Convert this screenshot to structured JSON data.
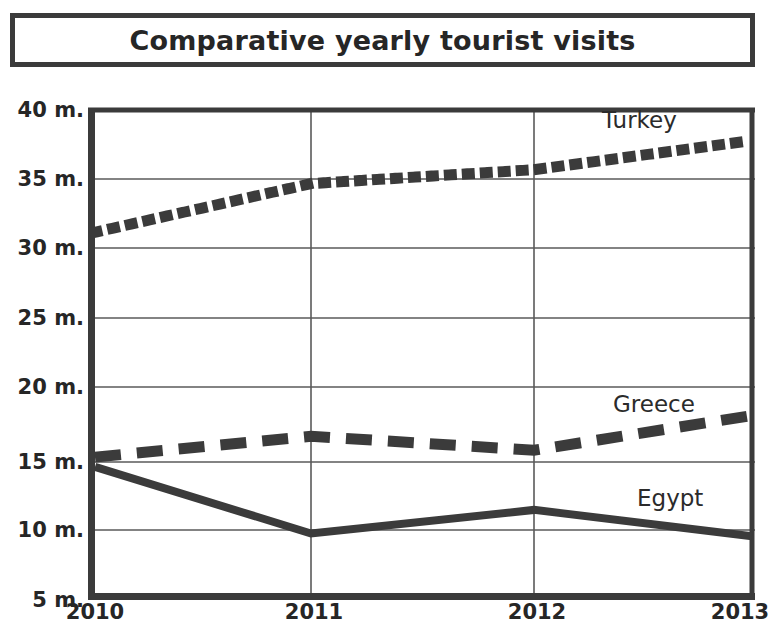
{
  "header": {
    "title": "Comparative yearly tourist visits"
  },
  "chart_data": {
    "type": "line",
    "title": "Comparative yearly tourist visits",
    "xlabel": "",
    "ylabel": "",
    "x": [
      "2010",
      "2011",
      "2012",
      "2013"
    ],
    "categories": [
      "2010",
      "2011",
      "2012",
      "2013"
    ],
    "ytick_labels": [
      "40 m.",
      "35 m.",
      "30 m.",
      "25 m.",
      "20 m.",
      "15 m.",
      "10 m.",
      "5 m."
    ],
    "ytick_values": [
      40,
      35,
      30,
      25,
      20,
      15,
      10,
      5
    ],
    "ylim": [
      5,
      40
    ],
    "xlim": [
      "2010",
      "2013"
    ],
    "grid": true,
    "legend_position": "inline-right-of-series",
    "units": "millions of visits",
    "series": [
      {
        "name": "Turkey",
        "label": "Turkey",
        "style": "dotted",
        "color": "#3b3b3b",
        "values": [
          31.2,
          34.7,
          35.7,
          37.8
        ]
      },
      {
        "name": "Greece",
        "label": "Greece",
        "style": "dashed",
        "color": "#3b3b3b",
        "values": [
          15.0,
          16.5,
          15.5,
          18.0
        ]
      },
      {
        "name": "Egypt",
        "label": "Egypt",
        "style": "solid",
        "color": "#3b3b3b",
        "values": [
          14.3,
          9.5,
          11.2,
          9.3
        ]
      }
    ],
    "annotations": [
      {
        "text": "Turkey",
        "series": "Turkey"
      },
      {
        "text": "Greece",
        "series": "Greece"
      },
      {
        "text": "Egypt",
        "series": "Egypt"
      }
    ]
  }
}
